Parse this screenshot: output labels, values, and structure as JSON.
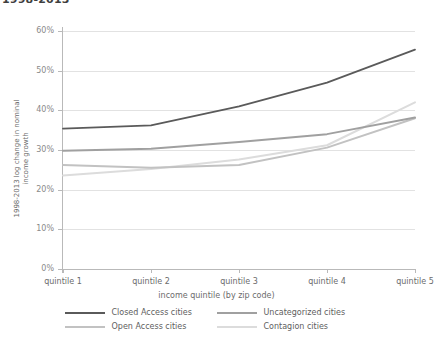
{
  "chart_data": {
    "type": "line",
    "title": "1998-2013",
    "xlabel": "income quintile (by zip code)",
    "ylabel": "1998-2013 log change in nominal\nincome growth",
    "categories": [
      "quintile 1",
      "quintile 2",
      "quintile 3",
      "quintile 4",
      "quintile 5"
    ],
    "ylim": [
      0,
      60
    ],
    "yticks": [
      "0%",
      "10%",
      "20%",
      "30%",
      "40%",
      "50%",
      "60%"
    ],
    "ytick_values": [
      0,
      10,
      20,
      30,
      40,
      50,
      60
    ],
    "grid": true,
    "legend_position": "bottom",
    "series": [
      {
        "name": "Closed Access cities",
        "color": "#5a5a5a",
        "values": [
          35.4,
          36.2,
          41.0,
          47.0,
          55.3
        ]
      },
      {
        "name": "Uncategorized cities",
        "color": "#a0a0a0",
        "values": [
          29.8,
          30.3,
          32.0,
          34.0,
          38.2
        ]
      },
      {
        "name": "Open Access cities",
        "color": "#c2c2c2",
        "values": [
          26.2,
          25.5,
          26.2,
          30.6,
          38.0
        ]
      },
      {
        "name": "Contagion cities",
        "color": "#dcdcdc",
        "values": [
          23.6,
          25.2,
          27.6,
          31.2,
          42.0
        ]
      }
    ]
  },
  "colors": {
    "axis": "#b9b9b9",
    "grid": "#e2e2e2",
    "text": "#6b6b6b",
    "background": "#ffffff"
  }
}
